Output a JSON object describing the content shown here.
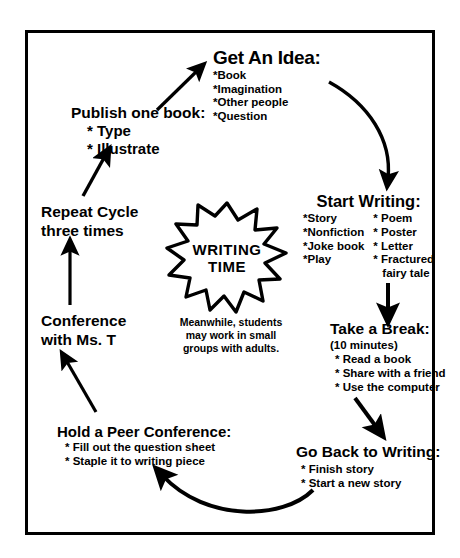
{
  "diagram": {
    "frame_color": "#000000",
    "background": "#ffffff",
    "center": {
      "badge_line1": "WRITING",
      "badge_line2": "TIME",
      "note_lines": [
        "Meanwhile, students",
        "may work in small",
        "groups with adults."
      ]
    },
    "nodes": [
      {
        "id": "get-an-idea",
        "title": "Get An Idea:",
        "items": [
          "*Book",
          "*Imagination",
          "*Other people",
          "*Question"
        ]
      },
      {
        "id": "start-writing",
        "title": "Start Writing:",
        "items_col1": [
          "*Story",
          "*Nonfiction",
          "*Joke book",
          "*Play"
        ],
        "items_col2": [
          "* Poem",
          "* Poster",
          "* Letter",
          "* Fractured",
          "fairy tale"
        ]
      },
      {
        "id": "take-a-break",
        "title": "Take a Break:",
        "subtitle": "(10 minutes)",
        "items": [
          "* Read a book",
          "* Share with a friend",
          "* Use the computer"
        ]
      },
      {
        "id": "go-back-to-writing",
        "title": "Go Back to Writing:",
        "items": [
          "* Finish story",
          "* Start a new story"
        ]
      },
      {
        "id": "hold-a-peer-conference",
        "title": "Hold a Peer Conference:",
        "items": [
          "* Fill out the question sheet",
          "* Staple it to writing piece"
        ]
      },
      {
        "id": "conference-with-ms-t",
        "title_line1": "Conference",
        "title_line2": "with Ms. T"
      },
      {
        "id": "repeat-cycle",
        "title_line1": "Repeat Cycle",
        "title_line2": "three times"
      },
      {
        "id": "publish-one-book",
        "title": "Publish one book:",
        "items": [
          "* Type",
          "* Illustrate"
        ]
      }
    ],
    "arrows": [
      {
        "id": "publish-to-idea",
        "from": "publish-one-book",
        "to": "get-an-idea",
        "style": "straight-diagonal"
      },
      {
        "id": "idea-to-start",
        "from": "get-an-idea",
        "to": "start-writing",
        "style": "curved"
      },
      {
        "id": "start-to-break",
        "from": "start-writing",
        "to": "take-a-break",
        "style": "straight-vertical"
      },
      {
        "id": "break-to-goback",
        "from": "take-a-break",
        "to": "go-back-to-writing",
        "style": "straight-diagonal"
      },
      {
        "id": "goback-to-peer",
        "from": "go-back-to-writing",
        "to": "hold-a-peer-conference",
        "style": "curved"
      },
      {
        "id": "peer-to-conference",
        "from": "hold-a-peer-conference",
        "to": "conference-with-ms-t",
        "style": "straight-diagonal"
      },
      {
        "id": "conference-to-repeat",
        "from": "conference-with-ms-t",
        "to": "repeat-cycle",
        "style": "straight-vertical"
      },
      {
        "id": "repeat-to-publish",
        "from": "repeat-cycle",
        "to": "publish-one-book",
        "style": "straight-diagonal"
      }
    ]
  }
}
